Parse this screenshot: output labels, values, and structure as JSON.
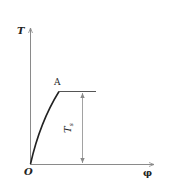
{
  "diagram": {
    "type": "torque-twist curve",
    "axes": {
      "y_label": "T",
      "x_label": "φ",
      "origin_label": "O"
    },
    "points": {
      "A": {
        "label": "A"
      }
    },
    "dimension": {
      "label": "T",
      "subscript": "s"
    },
    "colors": {
      "axis": "#8a8a8a",
      "curve": "#222222",
      "text": "#222222"
    }
  }
}
